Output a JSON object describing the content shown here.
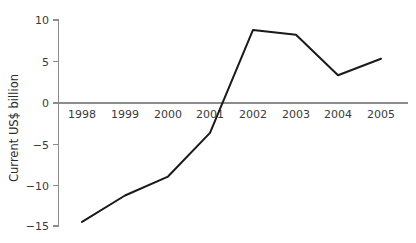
{
  "chart_data": {
    "type": "line",
    "title": "",
    "subtitle": "",
    "xlabel": "",
    "ylabel": "Current US$ billion",
    "categories": [
      "1998",
      "1999",
      "2000",
      "2001",
      "2002",
      "2003",
      "2004",
      "2005"
    ],
    "x": [
      1998,
      1999,
      2000,
      2001,
      2002,
      2003,
      2004,
      2005
    ],
    "values": [
      -14.5,
      -11.3,
      -9.0,
      -3.7,
      8.8,
      8.2,
      3.3,
      5.3
    ],
    "series": [
      {
        "name": "",
        "values": [
          -14.5,
          -11.3,
          -9.0,
          -3.7,
          8.8,
          8.2,
          3.3,
          5.3
        ]
      }
    ],
    "ylim": [
      -15,
      10
    ],
    "yticks": [
      10,
      5,
      0,
      -5,
      -10,
      -15
    ],
    "ytick_labels": [
      "10",
      "5",
      "0",
      "−5",
      "−10",
      "−15"
    ],
    "xtick_labels": [
      "1998",
      "1999",
      "2000",
      "2001",
      "2002",
      "2003",
      "2004",
      "2005"
    ],
    "grid": false,
    "legend": false,
    "legend_position": "none",
    "zero_line": true,
    "line_color": "#1a1a1a",
    "axis_color": "#8c8c8c",
    "background_color": "#ffffff",
    "markers": false
  },
  "axes": {
    "y_title": "Current US$ billion"
  }
}
